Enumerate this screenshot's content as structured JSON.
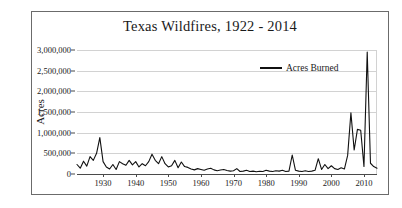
{
  "chart_data": {
    "type": "line",
    "title": "Texas Wildfires, 1922 - 2014",
    "xlabel": "",
    "ylabel": "Acres",
    "xlim": [
      1922,
      2014
    ],
    "ylim": [
      0,
      3000000
    ],
    "grid": true,
    "legend_position": "top-right",
    "y_ticks": [
      {
        "value": 3000000,
        "label": "3,000,000"
      },
      {
        "value": 2500000,
        "label": "2,500,000"
      },
      {
        "value": 2000000,
        "label": "2,000,000"
      },
      {
        "value": 1500000,
        "label": "1,500,000"
      },
      {
        "value": 1000000,
        "label": "1,000,000"
      },
      {
        "value": 500000,
        "label": "500,000"
      },
      {
        "value": 0,
        "label": "0"
      }
    ],
    "x_ticks": [
      {
        "value": 1930,
        "label": "1930"
      },
      {
        "value": 1940,
        "label": "1940"
      },
      {
        "value": 1950,
        "label": "1950"
      },
      {
        "value": 1960,
        "label": "1960"
      },
      {
        "value": 1970,
        "label": "1970"
      },
      {
        "value": 1980,
        "label": "1980"
      },
      {
        "value": 1990,
        "label": "1990"
      },
      {
        "value": 2000,
        "label": "2000"
      },
      {
        "value": 2010,
        "label": "2010"
      }
    ],
    "series": [
      {
        "name": "Acres Burned",
        "color": "#111111",
        "x": [
          1922,
          1923,
          1924,
          1925,
          1926,
          1927,
          1928,
          1929,
          1930,
          1931,
          1932,
          1933,
          1934,
          1935,
          1936,
          1937,
          1938,
          1939,
          1940,
          1941,
          1942,
          1943,
          1944,
          1945,
          1946,
          1947,
          1948,
          1949,
          1950,
          1951,
          1952,
          1953,
          1954,
          1955,
          1956,
          1957,
          1958,
          1959,
          1960,
          1961,
          1962,
          1963,
          1964,
          1965,
          1966,
          1967,
          1968,
          1969,
          1970,
          1971,
          1972,
          1973,
          1974,
          1975,
          1976,
          1977,
          1978,
          1979,
          1980,
          1981,
          1982,
          1983,
          1984,
          1985,
          1986,
          1987,
          1988,
          1989,
          1990,
          1991,
          1992,
          1993,
          1994,
          1995,
          1996,
          1997,
          1998,
          1999,
          2000,
          2001,
          2002,
          2003,
          2004,
          2005,
          2006,
          2007,
          2008,
          2009,
          2010,
          2011,
          2012,
          2013,
          2014
        ],
        "values": [
          230000,
          140000,
          310000,
          190000,
          420000,
          330000,
          500000,
          880000,
          300000,
          170000,
          120000,
          230000,
          110000,
          300000,
          250000,
          210000,
          330000,
          220000,
          300000,
          170000,
          250000,
          200000,
          300000,
          480000,
          330000,
          250000,
          420000,
          250000,
          170000,
          200000,
          330000,
          150000,
          290000,
          180000,
          160000,
          120000,
          100000,
          130000,
          110000,
          90000,
          120000,
          140000,
          100000,
          80000,
          95000,
          110000,
          85000,
          70000,
          80000,
          130000,
          60000,
          70000,
          90000,
          60000,
          70000,
          55000,
          65000,
          60000,
          90000,
          70000,
          60000,
          80000,
          70000,
          90000,
          60000,
          70000,
          460000,
          90000,
          70000,
          60000,
          80000,
          60000,
          70000,
          90000,
          370000,
          110000,
          230000,
          130000,
          200000,
          130000,
          110000,
          150000,
          120000,
          450000,
          1480000,
          580000,
          1080000,
          1060000,
          180000,
          2950000,
          260000,
          180000,
          140000
        ]
      }
    ],
    "legend": [
      {
        "label": "Acres Burned",
        "color": "#111111"
      }
    ]
  }
}
